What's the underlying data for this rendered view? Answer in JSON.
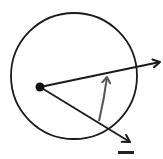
{
  "diagram": {
    "colors": {
      "background": "#ffffff",
      "stroke": "#1a1a1a",
      "angle_arrow": "#555555"
    },
    "circle": {
      "cx": 74,
      "cy": 76,
      "r": 63
    },
    "center_point": {
      "cx": 40,
      "cy": 87,
      "r": 4.5
    },
    "rays": [
      {
        "name": "initial-side",
        "x1": 40,
        "y1": 87,
        "x2": 161,
        "y2": 62
      },
      {
        "name": "terminal-side",
        "x1": 40,
        "y1": 87,
        "x2": 131,
        "y2": 143
      }
    ],
    "angle_arrow": {
      "from": [
        99,
        121
      ],
      "to": [
        107,
        75
      ],
      "direction": "counterclockwise"
    }
  }
}
